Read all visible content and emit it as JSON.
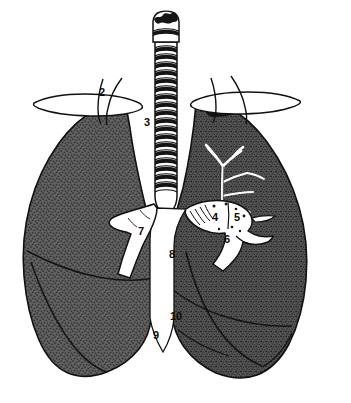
{
  "figure": {
    "background_color": "#ffffff",
    "ink_color": "#111111",
    "lung_fill_color": "#5d5d5d",
    "lung_texture": "stipple",
    "highlight_color": "#ffffff",
    "width": 351,
    "height": 403
  },
  "labels": [
    {
      "id": "label-2",
      "text": "2",
      "x": 99,
      "y": 87,
      "on_dark": false
    },
    {
      "id": "label-3",
      "text": "3",
      "x": 144,
      "y": 117,
      "on_dark": false
    },
    {
      "id": "label-4",
      "text": "4",
      "x": 212,
      "y": 212,
      "on_dark": true
    },
    {
      "id": "label-5",
      "text": "5",
      "x": 234,
      "y": 212,
      "on_dark": true
    },
    {
      "id": "label-6",
      "text": "6",
      "x": 224,
      "y": 234,
      "on_dark": true
    },
    {
      "id": "label-7",
      "text": "7",
      "x": 138,
      "y": 226,
      "on_dark": false
    },
    {
      "id": "label-8",
      "text": "8",
      "x": 169,
      "y": 249,
      "on_dark": false
    },
    {
      "id": "label-9",
      "text": "9",
      "x": 153,
      "y": 330,
      "on_dark": false
    },
    {
      "id": "label-10",
      "text": "10",
      "x": 170,
      "y": 311,
      "on_dark": false
    }
  ],
  "structures": {
    "larynx": "larynx",
    "trachea": "trachea-with-cartilage-rings",
    "left_lung": "left-lung-shaded",
    "right_lung": "right-lung-shaded",
    "left_clavicle": "left-clavicle",
    "right_clavicle": "right-clavicle",
    "bronchial_tree": "bronchial-tree-branches",
    "hilum": "hilar-vessels",
    "main_bronchus": "left-main-bronchus",
    "fissures": "interlobar-fissures"
  },
  "trachea_rings": 19
}
